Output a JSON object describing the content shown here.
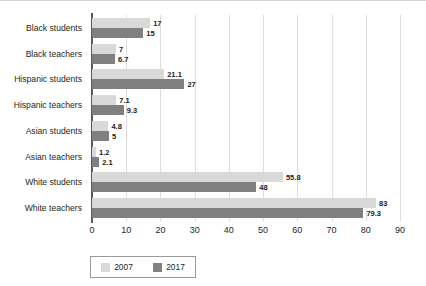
{
  "chart_data": {
    "type": "bar",
    "orientation": "horizontal",
    "title": "",
    "xlabel": "",
    "ylabel": "",
    "xlim": [
      0,
      90
    ],
    "xticks": [
      0,
      10,
      20,
      30,
      40,
      50,
      60,
      70,
      80,
      90
    ],
    "grid": true,
    "legend_position": "bottom-left",
    "categories": [
      "Black students",
      "Black teachers",
      "Hispanic students",
      "Hispanic teachers",
      "Asian students",
      "Asian teachers",
      "White students",
      "White teachers"
    ],
    "series": [
      {
        "name": "2007",
        "color": "#d9d9d9",
        "values": [
          17,
          7,
          21.1,
          7.1,
          4.8,
          1.2,
          55.8,
          83
        ],
        "labels": [
          "17",
          "7",
          "21.1",
          "7.1",
          "4.8",
          "1.2",
          "55.8",
          "83"
        ]
      },
      {
        "name": "2017",
        "color": "#808080",
        "values": [
          15,
          6.7,
          27,
          9.3,
          5,
          2.1,
          48,
          79.3
        ],
        "labels": [
          "15",
          "6.7",
          "27",
          "9.3",
          "5",
          "2.1",
          "48",
          "79.3"
        ]
      }
    ]
  },
  "legend": {
    "entries": [
      {
        "label": "2007",
        "color": "#d9d9d9"
      },
      {
        "label": "2017",
        "color": "#808080"
      }
    ]
  },
  "colors": {
    "series_2007": "#d9d9d9",
    "series_2017": "#808080",
    "axis": "#58595b",
    "gridline": "#dcdcdc",
    "text": "#231f20",
    "background": "#ffffff"
  }
}
